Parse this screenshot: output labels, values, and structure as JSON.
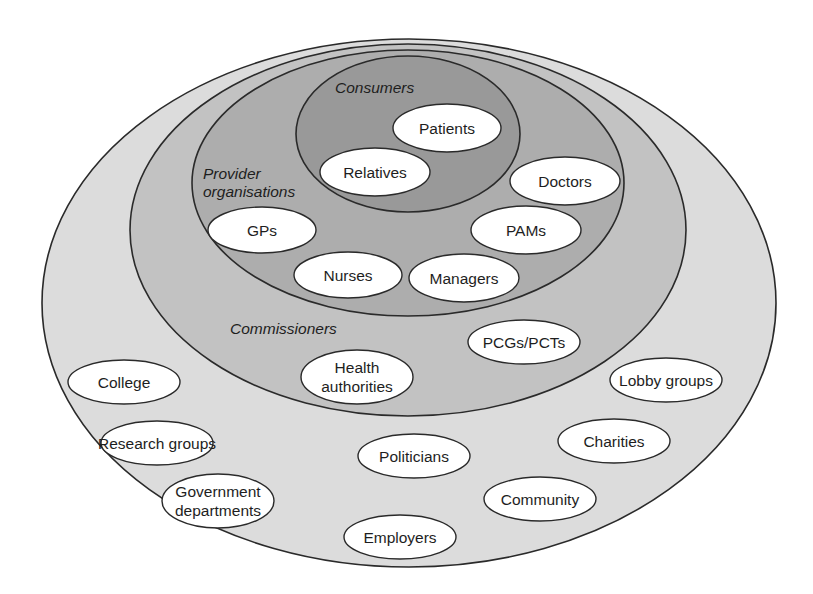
{
  "colors": {
    "background": "#ffffff",
    "stakeholders_fill": "#dcdcdc",
    "commissioners_fill": "#c2c2c2",
    "providers_fill": "#adadad",
    "consumers_fill": "#999999",
    "node_fill": "#ffffff",
    "stroke": "#2a2a2a"
  },
  "rings": [
    {
      "id": "stakeholders",
      "label": "",
      "cx": 409,
      "cy": 303,
      "rx": 367,
      "ry": 264
    },
    {
      "id": "commissioners",
      "label": "Commissioners",
      "cx": 408,
      "cy": 230,
      "rx": 278,
      "ry": 186,
      "label_x": 230,
      "label_y": 334
    },
    {
      "id": "provider-organisations",
      "label_lines": [
        "Provider",
        "organisations"
      ],
      "cx": 408,
      "cy": 183,
      "rx": 216,
      "ry": 133,
      "label_x": 203,
      "label_y": 179
    },
    {
      "id": "consumers",
      "label": "Consumers",
      "cx": 408,
      "cy": 134,
      "rx": 112,
      "ry": 78,
      "label_x": 335,
      "label_y": 93
    }
  ],
  "nodes": {
    "consumers": [
      {
        "label": "Patients",
        "cx": 447,
        "cy": 128,
        "rx": 54,
        "ry": 24
      },
      {
        "label": "Relatives",
        "cx": 375,
        "cy": 172,
        "rx": 55,
        "ry": 24
      }
    ],
    "providers": [
      {
        "label": "Doctors",
        "cx": 565,
        "cy": 181,
        "rx": 55,
        "ry": 24
      },
      {
        "label": "GPs",
        "cx": 262,
        "cy": 230,
        "rx": 54,
        "ry": 23
      },
      {
        "label": "PAMs",
        "cx": 526,
        "cy": 230,
        "rx": 55,
        "ry": 24
      },
      {
        "label": "Nurses",
        "cx": 348,
        "cy": 275,
        "rx": 54,
        "ry": 23
      },
      {
        "label": "Managers",
        "cx": 464,
        "cy": 278,
        "rx": 55,
        "ry": 24
      }
    ],
    "commissioners": [
      {
        "label": "PCGs/PCTs",
        "cx": 524,
        "cy": 342,
        "rx": 56,
        "ry": 22
      },
      {
        "label_lines": [
          "Health",
          "authorities"
        ],
        "cx": 357,
        "cy": 377,
        "rx": 56,
        "ry": 27
      }
    ],
    "stakeholders": [
      {
        "label": "College",
        "cx": 124,
        "cy": 382,
        "rx": 56,
        "ry": 22
      },
      {
        "label": "Lobby groups",
        "cx": 666,
        "cy": 380,
        "rx": 56,
        "ry": 22
      },
      {
        "label": "Research groups",
        "cx": 157,
        "cy": 443,
        "rx": 56,
        "ry": 22
      },
      {
        "label": "Charities",
        "cx": 614,
        "cy": 441,
        "rx": 56,
        "ry": 22
      },
      {
        "label": "Politicians",
        "cx": 414,
        "cy": 456,
        "rx": 56,
        "ry": 22
      },
      {
        "label_lines": [
          "Government",
          "departments"
        ],
        "cx": 218,
        "cy": 501,
        "rx": 56,
        "ry": 27
      },
      {
        "label": "Community",
        "cx": 540,
        "cy": 499,
        "rx": 56,
        "ry": 22
      },
      {
        "label": "Employers",
        "cx": 400,
        "cy": 537,
        "rx": 56,
        "ry": 22
      }
    ]
  }
}
